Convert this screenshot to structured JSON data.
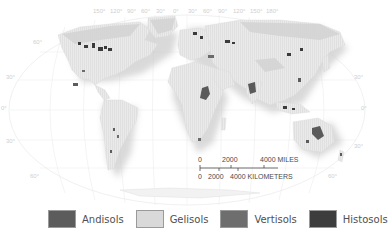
{
  "map": {
    "title": "",
    "projection": "Robinson-like world map",
    "longitude_labels": [
      "150°",
      "120°",
      "90°",
      "60°",
      "30°",
      "0°",
      "30°",
      "60°",
      "90°",
      "120°",
      "150°",
      "180°"
    ],
    "latitude_labels_left": [
      "60°",
      "30°",
      "0°",
      "30°",
      "60°"
    ],
    "latitude_labels_right": [
      "60°",
      "30°",
      "0°",
      "30°",
      "60°"
    ],
    "colors": {
      "background": "#ffffff",
      "land": "#e6e6e6",
      "land_shadow": "#cfcfcf",
      "graticule": "#e2e2e2",
      "andisols": "#5c5c5c",
      "gelisols": "#d4d4d4",
      "vertisols": "#6b6b6b",
      "histosols": "#3a3a3a"
    }
  },
  "scale_bar": {
    "miles_ticks": [
      "0",
      "2000",
      "4000 MILES"
    ],
    "km_ticks": [
      "0",
      "2000",
      "4000 KILOMETERS"
    ]
  },
  "legend": {
    "items": [
      {
        "label": "Andisols",
        "color": "#5c5c5c"
      },
      {
        "label": "Gelisols",
        "color": "#d9d9d9"
      },
      {
        "label": "Vertisols",
        "color": "#6e6e6e"
      },
      {
        "label": "Histosols",
        "color": "#3d3d3d"
      }
    ]
  }
}
